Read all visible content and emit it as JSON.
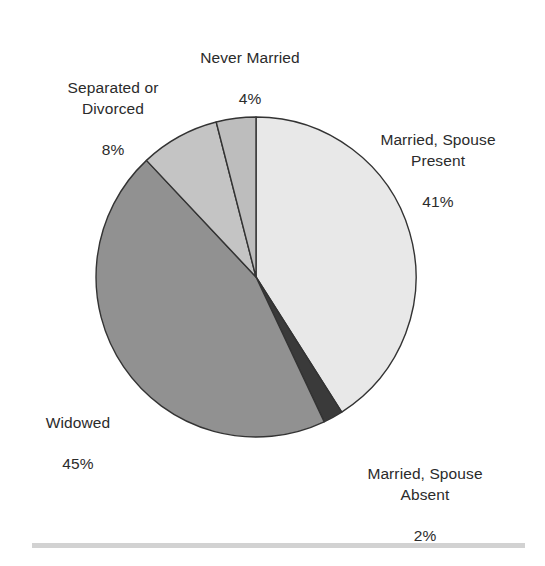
{
  "chart_data": {
    "type": "pie",
    "title": "",
    "subtitle": "",
    "xlabel": "",
    "ylabel": "",
    "grid": false,
    "legend_position": "none",
    "label_style": "outside-callout-free",
    "start_angle_deg": 90,
    "direction": "clockwise",
    "units": "percent",
    "total": 100,
    "categories": [
      "Married, Spouse Present",
      "Married, Spouse Absent",
      "Widowed",
      "Separated or Divorced",
      "Never Married"
    ],
    "values": [
      41,
      2,
      45,
      8,
      4
    ],
    "slices": [
      {
        "label": "Married, Spouse Present",
        "label_line1": "Married, Spouse",
        "label_line2": "Present",
        "value": 41,
        "value_text": "41%",
        "color": "#e8e8e8"
      },
      {
        "label": "Married, Spouse Absent",
        "label_line1": "Married, Spouse",
        "label_line2": "Absent",
        "value": 2,
        "value_text": "2%",
        "color": "#3a3a3a"
      },
      {
        "label": "Widowed",
        "label_line1": "Widowed",
        "label_line2": "",
        "value": 45,
        "value_text": "45%",
        "color": "#919191"
      },
      {
        "label": "Separated or Divorced",
        "label_line1": "Separated or",
        "label_line2": "Divorced",
        "value": 8,
        "value_text": "8%",
        "color": "#c4c4c4"
      },
      {
        "label": "Never Married",
        "label_line1": "Never Married",
        "label_line2": "",
        "value": 4,
        "value_text": "4%",
        "color": "#bdbdbd"
      }
    ]
  },
  "labels": {
    "never_married": {
      "name": "Never Married",
      "value_text": "4%"
    },
    "separated_divorced": {
      "name": "Separated or\nDivorced",
      "value_text": "8%"
    },
    "married_present": {
      "name": "Married, Spouse\nPresent",
      "value_text": "41%"
    },
    "widowed": {
      "name": "Widowed",
      "value_text": "45%"
    },
    "married_absent": {
      "name": "Married, Spouse\nAbsent",
      "value_text": "2%"
    }
  },
  "style": {
    "background": "#ffffff",
    "text_color": "#2b2b2b",
    "outline_color": "#333333",
    "rule_color": "#d2d2d2"
  },
  "geometry": {
    "center_x": 256,
    "center_y": 277,
    "radius": 160
  }
}
